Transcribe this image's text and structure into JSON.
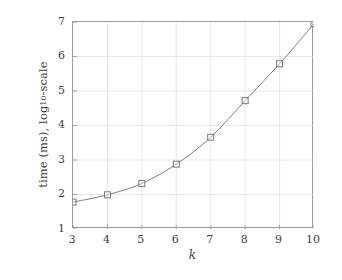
{
  "chart_data": {
    "type": "line",
    "title": "",
    "subtitle": "",
    "xlabel": "k",
    "ylabel_parts": {
      "prefix": "time (ms), log",
      "subscript": "10",
      "suffix": "-scale"
    },
    "ylabel": "time (ms), log10-scale",
    "x": [
      3,
      4,
      5,
      6,
      7,
      8,
      9,
      10
    ],
    "values": [
      1.78,
      1.99,
      2.32,
      2.88,
      3.66,
      4.72,
      5.79,
      6.95
    ],
    "series": [
      {
        "name": "time",
        "values": [
          1.78,
          1.99,
          2.32,
          2.88,
          3.66,
          4.72,
          5.79,
          6.95
        ]
      }
    ],
    "xlim": [
      3,
      10
    ],
    "ylim": [
      1,
      7
    ],
    "xticks": [
      "3",
      "4",
      "5",
      "6",
      "7",
      "8",
      "9",
      "10"
    ],
    "yticks": [
      "1",
      "2",
      "3",
      "4",
      "5",
      "6",
      "7"
    ],
    "xtick_values": [
      3,
      4,
      5,
      6,
      7,
      8,
      9,
      10
    ],
    "ytick_values": [
      1,
      2,
      3,
      4,
      5,
      6,
      7
    ],
    "grid": true,
    "legend": null,
    "legend_position": "none",
    "marker": "open-square",
    "line_style": "solid",
    "colors": {
      "line": "#808080",
      "marker_stroke": "#6e6e6e",
      "marker_fill": "#ffffff",
      "axis": "#9a9a9a",
      "grid": "#e2e2e2",
      "text": "#3f3f3f",
      "background": "#ffffff"
    }
  }
}
